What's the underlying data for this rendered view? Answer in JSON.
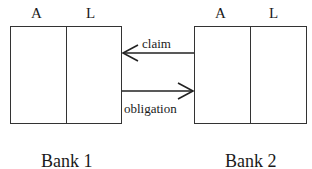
{
  "banks": [
    {
      "name": "Bank 1",
      "columns": [
        "A",
        "L"
      ]
    },
    {
      "name": "Bank 2",
      "columns": [
        "A",
        "L"
      ]
    }
  ],
  "arrows": [
    {
      "label": "claim",
      "from": "Bank 2",
      "to": "Bank 1",
      "direction": "left"
    },
    {
      "label": "obligation",
      "from": "Bank 1",
      "to": "Bank 2",
      "direction": "right"
    }
  ]
}
